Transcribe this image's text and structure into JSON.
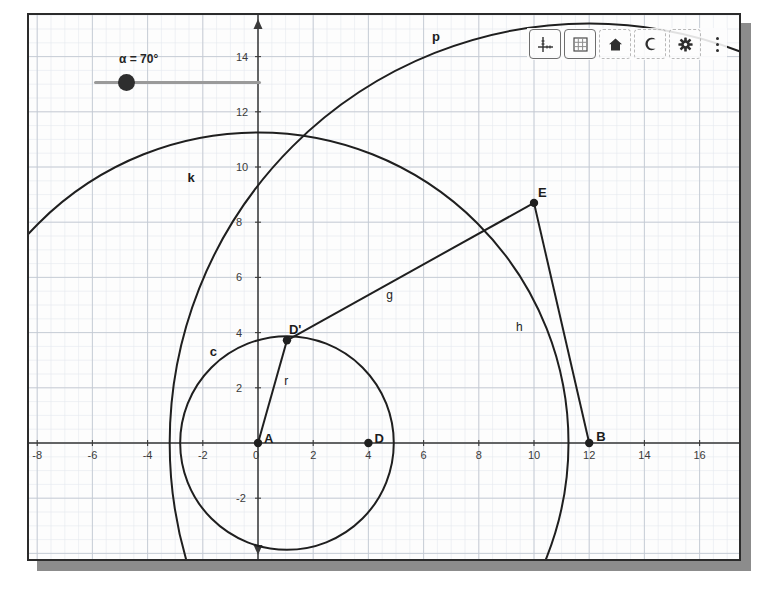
{
  "app": {
    "name": "GeoGebra Graphics View",
    "background": "#fdfdfd",
    "frame_color": "#2b2b2b",
    "shadow_color": "#8c8c8c"
  },
  "toolbar": {
    "buttons": [
      {
        "name": "axes-icon",
        "label": "Axes",
        "style": "boxed"
      },
      {
        "name": "grid-icon",
        "label": "Grid",
        "style": "boxed"
      },
      {
        "name": "home-icon",
        "label": "Standard View",
        "style": "dashed"
      },
      {
        "name": "undo-icon",
        "label": "Undo",
        "style": "dashed",
        "glyph": "C"
      },
      {
        "name": "gear-icon",
        "label": "Settings",
        "style": "dashed"
      }
    ],
    "menu_label": "More options"
  },
  "slider": {
    "name": "alpha-slider",
    "caption": "α = 70°",
    "variable": "α",
    "value": 70,
    "unit": "°",
    "min": 0,
    "max": 360,
    "knob_fraction": 0.194
  },
  "axes": {
    "x_label": "x",
    "y_label": "y",
    "x_ticks": [
      -8,
      -6,
      -4,
      -2,
      0,
      2,
      4,
      6,
      8,
      10,
      12,
      14,
      16
    ],
    "x_ticks_shown": [
      -8,
      -6,
      -4,
      -2,
      0,
      2,
      4,
      6,
      8,
      10,
      12,
      14,
      16
    ],
    "y_ticks_shown": [
      -2,
      2,
      4,
      6,
      8,
      10,
      12,
      14
    ],
    "origin_px": [
      258,
      443
    ],
    "unit_px": 27.6,
    "x_range": [
      -8.4,
      17.5
    ],
    "y_range": [
      -4.3,
      15.5
    ],
    "grid": true,
    "major_grid_step": 2,
    "minor_grid_step": 0.5,
    "axis_color": "#3a3a3a",
    "major_grid_color": "#c3c8d2",
    "minor_grid_color": "#e4e7ee"
  },
  "chart_data": {
    "type": "scatter",
    "title": "",
    "xlabel": "x",
    "ylabel": "y",
    "xlim": [
      -8.4,
      17.5
    ],
    "ylim": [
      -4.3,
      15.5
    ],
    "grid": true,
    "points": [
      {
        "name": "A",
        "x": 0,
        "y": 0,
        "label": "A",
        "label_dx": 6,
        "label_dy": -6
      },
      {
        "name": "D",
        "x": 4,
        "y": 0,
        "label": "D",
        "label_dx": 6,
        "label_dy": -6
      },
      {
        "name": "B",
        "x": 12,
        "y": 0,
        "label": "B",
        "label_dx": 7,
        "label_dy": -8
      },
      {
        "name": "E",
        "x": 10,
        "y": 8.7,
        "label": "E",
        "label_dx": 4,
        "label_dy": -12
      },
      {
        "name": "Dprime",
        "x": 1.05,
        "y": 3.72,
        "label": "D'",
        "label_dx": 2,
        "label_dy": -12
      }
    ],
    "circles": [
      {
        "name": "c",
        "cx": 1.05,
        "cy": 0,
        "r": 3.87,
        "label": "c",
        "label_x": -1.75,
        "label_y": 3.35
      },
      {
        "name": "k",
        "cx": 0,
        "cy": 0,
        "r": 11.25,
        "label": "k",
        "label_x": -2.55,
        "label_y": 9.65
      },
      {
        "name": "p",
        "cx": 12,
        "cy": 0,
        "r": 15.2,
        "label": "p",
        "label_x": 6.3,
        "label_y": 14.75
      }
    ],
    "segments": [
      {
        "name": "r",
        "from": "A",
        "to": "Dprime",
        "x1": 0,
        "y1": 0,
        "x2": 1.05,
        "y2": 3.72,
        "label": "r",
        "label_x": 0.95,
        "label_y": 2.25
      },
      {
        "name": "g",
        "from": "Dprime",
        "to": "E",
        "x1": 1.05,
        "y1": 3.72,
        "x2": 10,
        "y2": 8.7,
        "label": "g",
        "label_x": 4.65,
        "label_y": 5.35
      },
      {
        "name": "h",
        "from": "E",
        "to": "B",
        "x1": 10,
        "y1": 8.7,
        "x2": 12,
        "y2": 0,
        "label": "h",
        "label_x": 9.35,
        "label_y": 4.2
      }
    ],
    "stroke_color": "#1f1f1f",
    "point_color": "#1f1f1f"
  }
}
